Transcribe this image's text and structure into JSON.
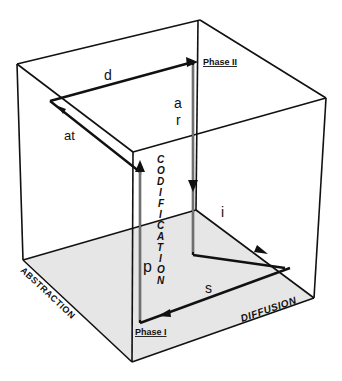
{
  "diagram": {
    "type": "3d-cube-cycle",
    "axes": {
      "vertical": "CODIFICATION",
      "left": "ABSTRACTION",
      "right": "DIFFUSION"
    },
    "phases": {
      "phase1": "Phase I",
      "phase2": "Phase II"
    },
    "path_labels": {
      "d": "d",
      "ar_a": "a",
      "ar_r": "r",
      "at": "at",
      "p": "p",
      "i": "i",
      "s": "s"
    },
    "codification_letters": [
      "C",
      "O",
      "D",
      "I",
      "F",
      "I",
      "C",
      "A",
      "T",
      "I",
      "O",
      "N"
    ],
    "colors": {
      "line": "#111111",
      "floor": "#e6e6e6",
      "background": "#ffffff"
    }
  }
}
